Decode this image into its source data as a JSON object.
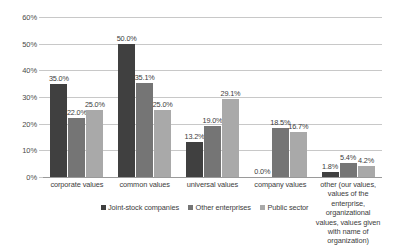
{
  "chart_data": {
    "type": "bar",
    "title": "",
    "subtitle": "",
    "xlabel": "",
    "ylabel": "",
    "ylim": [
      0,
      60
    ],
    "ytick_labels": [
      "0%",
      "10%",
      "20%",
      "30%",
      "40%",
      "50%",
      "60%"
    ],
    "ytick_values": [
      0,
      10,
      20,
      30,
      40,
      50,
      60
    ],
    "grid": true,
    "legend_position": "bottom",
    "categories": [
      "corporate values",
      "common values",
      "universal values",
      "company values",
      "other (our values, values of the enterprise, organizational values, values given with name of organization)"
    ],
    "series": [
      {
        "name": "Joint-stock companies",
        "color": "#404040",
        "values": [
          35.0,
          50.0,
          13.2,
          0.0,
          1.8
        ],
        "labels": [
          "35.0%",
          "50.0%",
          "13.2%",
          "0.0%",
          "1.8%"
        ]
      },
      {
        "name": "Other enterprises",
        "color": "#757575",
        "values": [
          22.0,
          35.1,
          19.0,
          18.5,
          5.4
        ],
        "labels": [
          "22.0%",
          "35.1%",
          "19.0%",
          "18.5%",
          "5.4%"
        ]
      },
      {
        "name": "Public sector",
        "color": "#a9a9a9",
        "values": [
          25.0,
          25.0,
          29.1,
          16.7,
          4.2
        ],
        "labels": [
          "25.0%",
          "25.0%",
          "29.1%",
          "16.7%",
          "4.2%"
        ]
      }
    ]
  },
  "axis": {
    "y_ticks": [
      {
        "label": "60%"
      },
      {
        "label": "50%"
      },
      {
        "label": "40%"
      },
      {
        "label": "30%"
      },
      {
        "label": "20%"
      },
      {
        "label": "10%"
      },
      {
        "label": "0%"
      }
    ]
  },
  "categories": [
    {
      "label": "corporate values"
    },
    {
      "label": "common values"
    },
    {
      "label": "universal values"
    },
    {
      "label": "company values"
    },
    {
      "label": "other (our values, values of the enterprise, organizational values, values given with name of organization)"
    }
  ],
  "legend": {
    "items": [
      {
        "label": "Joint-stock companies",
        "color": "#404040"
      },
      {
        "label": "Other enterprises",
        "color": "#757575"
      },
      {
        "label": "Public sector",
        "color": "#a9a9a9"
      }
    ]
  },
  "colors": {
    "series_1": "#404040",
    "series_2": "#757575",
    "series_3": "#a9a9a9",
    "gridline": "#c8c8c8",
    "axis": "#9a9a9a",
    "text": "#3c3c3c",
    "background": "#ffffff"
  }
}
